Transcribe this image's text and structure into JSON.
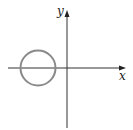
{
  "diagram": {
    "axes": {
      "x_label": "x",
      "y_label": "y",
      "origin": [
        67,
        68
      ],
      "axis_color": "#333333"
    },
    "circle": {
      "center": [
        38,
        68
      ],
      "radius": 18,
      "stroke": "#8a8a8a",
      "description": "circle centered on negative x-axis, left of y-axis"
    }
  }
}
